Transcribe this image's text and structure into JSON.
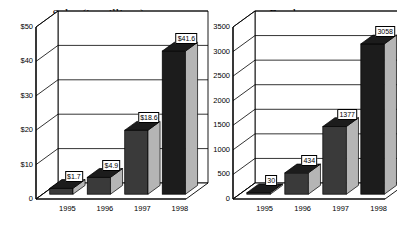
{
  "chart_data": [
    {
      "type": "bar",
      "title": "Sales (in millions)",
      "xlabel": "",
      "ylabel": "",
      "categories": [
        "1995",
        "1996",
        "1997",
        "1998"
      ],
      "values": [
        1.7,
        4.9,
        18.6,
        41.6
      ],
      "value_labels": [
        "$1.7",
        "$4.9",
        "$18.6",
        "$41.6"
      ],
      "ylim": [
        0,
        50
      ],
      "yticks": [
        0,
        10,
        20,
        30,
        40,
        50
      ],
      "ytick_labels": [
        "0",
        "$10",
        "$20",
        "$30",
        "$40",
        "$50"
      ],
      "grid": true,
      "legend": "none",
      "style_3d": true
    },
    {
      "type": "bar",
      "title": "Employees",
      "xlabel": "",
      "ylabel": "",
      "categories": [
        "1995",
        "1996",
        "1997",
        "1998"
      ],
      "values": [
        30,
        434,
        1377,
        3058
      ],
      "value_labels": [
        "30",
        "434",
        "1377",
        "3058"
      ],
      "ylim": [
        0,
        3500
      ],
      "yticks": [
        0,
        500,
        1000,
        1500,
        2000,
        2500,
        3000,
        3500
      ],
      "ytick_labels": [
        "0",
        "500",
        "1000",
        "1500",
        "2000",
        "2500",
        "3000",
        "3500"
      ],
      "grid": true,
      "legend": "none",
      "style_3d": true
    }
  ],
  "colors": {
    "bar_front": "#3a3a3a",
    "bar_side": "#b5b5b5",
    "bar_top": "#1c1c1c",
    "bar_front_light": "#4a4a4a",
    "plot_background": "#ffffff",
    "axis": "#000000",
    "gridline": "#000000",
    "wall_side": "#ffffff",
    "floor": "#ffffff",
    "label_border": "#000000",
    "label_background": "#ffffff",
    "text": "#000000"
  }
}
